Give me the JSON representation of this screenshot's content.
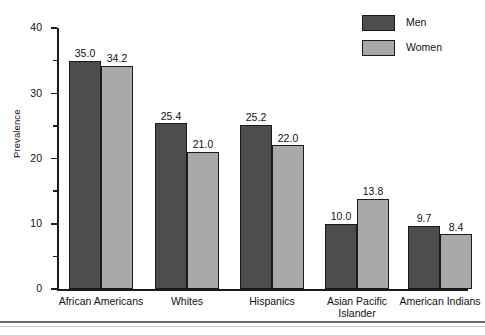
{
  "chart_data": {
    "type": "bar",
    "title": "",
    "xlabel": "",
    "ylabel": "Prevalence",
    "ylim": [
      0,
      40
    ],
    "ytick_major": [
      0,
      10,
      20,
      30,
      40
    ],
    "ytick_minor": [
      5,
      15,
      25,
      35
    ],
    "grid": false,
    "legend_position": "top-right",
    "categories": [
      "African Americans",
      "Whites",
      "Hispanics",
      "Asian Pacific\nIslander",
      "American Indians"
    ],
    "series": [
      {
        "name": "Men",
        "color": "#4d4d4d",
        "values": [
          35.0,
          25.4,
          25.2,
          10.0,
          9.7
        ],
        "labels": [
          "35.0",
          "25.4",
          "25.2",
          "10.0",
          "9.7"
        ]
      },
      {
        "name": "Women",
        "color": "#a9a9a9",
        "values": [
          34.2,
          21.0,
          22.0,
          13.8,
          8.4
        ],
        "labels": [
          "34.2",
          "21.0",
          "22.0",
          "13.8",
          "8.4"
        ]
      }
    ]
  },
  "axis": {
    "y_title": "Prevalence",
    "y_tick_labels": [
      "0",
      "10",
      "20",
      "30",
      "40"
    ]
  },
  "legend": {
    "items": [
      {
        "label": "Men",
        "color": "#4d4d4d"
      },
      {
        "label": "Women",
        "color": "#a9a9a9"
      }
    ]
  },
  "colors": {
    "men": "#4d4d4d",
    "women": "#a9a9a9",
    "outline": "#1a1a1a",
    "background": "#ffffff",
    "rule": "#6b6b6b"
  }
}
